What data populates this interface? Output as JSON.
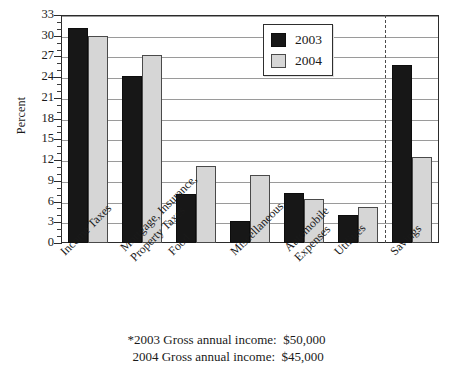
{
  "chart_data": {
    "type": "bar",
    "title": "",
    "xlabel": "",
    "ylabel": "Percent",
    "ylim": [
      0,
      33
    ],
    "ytick_step": 3,
    "yticks": [
      0,
      3,
      6,
      9,
      12,
      15,
      18,
      21,
      24,
      27,
      30,
      33
    ],
    "minor_ticks": true,
    "grid": true,
    "legend_position": "top-right",
    "categories": [
      "Income Taxes",
      "Mortgage, Insurance, Property Taxes",
      "Food",
      "Miscellaneous",
      "Automobile Expenses",
      "Utilities",
      "Savings"
    ],
    "category_lines": [
      [
        "Income Taxes"
      ],
      [
        "Mortgage, Insurance,",
        "Property Taxes"
      ],
      [
        "Food"
      ],
      [
        "Miscellaneous"
      ],
      [
        "Automobile",
        "Expenses"
      ],
      [
        "Utilities"
      ],
      [
        "Savings"
      ]
    ],
    "series": [
      {
        "name": "2003",
        "color": "#171717",
        "values": [
          31.1,
          24.2,
          7.1,
          3.2,
          7.3,
          4.0,
          25.7
        ]
      },
      {
        "name": "2004",
        "color": "#d6d6d6",
        "values": [
          30.0,
          27.2,
          11.1,
          9.9,
          6.3,
          5.2,
          12.5
        ]
      }
    ],
    "annotations": {
      "divider_after_category": "Utilities",
      "divider_style": "dashed-vertical"
    }
  },
  "legend": {
    "entries": [
      {
        "label": "2003",
        "swatch": "dark-square-swatch"
      },
      {
        "label": "2004",
        "swatch": "light-square-swatch"
      }
    ]
  },
  "footnotes": [
    "*2003 Gross annual income:  $50,000",
    " 2004 Gross annual income:  $45,000"
  ],
  "colors": {
    "series_2003": "#171717",
    "series_2004": "#d6d6d6",
    "frame": "#2b2b2b",
    "gridline": "#9a9a9a",
    "divider": "#4b4b4b",
    "background": "#ffffff"
  }
}
